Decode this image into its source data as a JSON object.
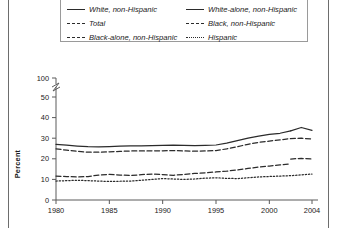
{
  "chart_data": {
    "type": "line",
    "title": "",
    "xlabel": "",
    "ylabel": "Percent",
    "xlim": [
      1980,
      2004
    ],
    "ylim": [
      0,
      50
    ],
    "y_axis_break": true,
    "y_break_top_label": "100",
    "yticks": [
      0,
      10,
      20,
      30,
      40,
      50,
      100
    ],
    "ytick_labels": [
      "0",
      "10",
      "20",
      "30",
      "40",
      "50",
      "100"
    ],
    "xticks": [
      1980,
      1985,
      1990,
      1995,
      2000,
      2004
    ],
    "xtick_labels": [
      "1980",
      "1985",
      "1990",
      "1995",
      "2000",
      "2004"
    ],
    "grid": false,
    "legend_position": "top",
    "series": [
      {
        "name": "White, non-Hispanic",
        "style": "solid",
        "x": [
          1980,
          1981,
          1982,
          1983,
          1984,
          1985,
          1986,
          1987,
          1988,
          1989,
          1990,
          1991,
          1992,
          1993,
          1994,
          1995,
          1996,
          1997,
          1998,
          1999,
          2000,
          2001,
          2002
        ],
        "values": [
          27.0,
          26.6,
          26.2,
          25.9,
          25.8,
          25.9,
          26.1,
          26.3,
          26.3,
          26.4,
          26.5,
          26.6,
          26.5,
          26.4,
          26.5,
          26.7,
          27.6,
          28.8,
          30.0,
          31.0,
          31.8,
          32.4,
          33.6
        ]
      },
      {
        "name": "White-alone, non-Hispanic",
        "style": "solid",
        "x": [
          2002,
          2003,
          2004
        ],
        "values": [
          33.6,
          35.2,
          33.8
        ]
      },
      {
        "name": "Total",
        "style": "dashed",
        "x": [
          1980,
          1981,
          1982,
          1983,
          1984,
          1985,
          1986,
          1987,
          1988,
          1989,
          1990,
          1991,
          1992,
          1993,
          1994,
          1995,
          1996,
          1997,
          1998,
          1999,
          2000,
          2001,
          2002,
          2003,
          2004
        ],
        "values": [
          24.8,
          24.2,
          23.6,
          23.2,
          23.2,
          23.4,
          23.6,
          23.8,
          23.8,
          23.9,
          23.9,
          24.0,
          23.8,
          23.7,
          23.8,
          24.0,
          24.8,
          25.9,
          27.0,
          28.0,
          28.6,
          29.2,
          29.8,
          30.0,
          29.6
        ]
      },
      {
        "name": "Black, non-Hispanic",
        "style": "dashed",
        "x": [
          1980,
          1981,
          1982,
          1983,
          1984,
          1985,
          1986,
          1987,
          1988,
          1989,
          1990,
          1991,
          1992,
          1993,
          1994,
          1995,
          1996,
          1997,
          1998,
          1999,
          2000,
          2001,
          2002
        ],
        "values": [
          11.6,
          11.4,
          11.2,
          11.4,
          12.1,
          12.4,
          12.1,
          11.9,
          12.3,
          12.6,
          12.3,
          12.0,
          12.4,
          12.9,
          13.2,
          13.6,
          14.0,
          14.6,
          15.3,
          16.0,
          16.5,
          17.0,
          17.6
        ]
      },
      {
        "name": "Black-alone, non-Hispanic",
        "style": "dashed",
        "x": [
          2002,
          2003,
          2004
        ],
        "values": [
          19.9,
          20.2,
          19.9
        ]
      },
      {
        "name": "Hispanic",
        "style": "dotted",
        "x": [
          1980,
          1981,
          1982,
          1983,
          1984,
          1985,
          1986,
          1987,
          1988,
          1989,
          1990,
          1991,
          1992,
          1993,
          1994,
          1995,
          1996,
          1997,
          1998,
          1999,
          2000,
          2001,
          2002,
          2003,
          2004
        ],
        "values": [
          9.2,
          9.4,
          9.6,
          9.4,
          9.2,
          9.0,
          9.1,
          9.2,
          9.6,
          10.0,
          10.4,
          10.2,
          10.0,
          10.2,
          10.6,
          10.8,
          10.5,
          10.4,
          10.8,
          11.2,
          11.4,
          11.6,
          11.8,
          12.2,
          12.6
        ]
      }
    ]
  },
  "legend": {
    "items": [
      {
        "label": "White, non-Hispanic",
        "style": "solid"
      },
      {
        "label": "White-alone, non-Hispanic",
        "style": "solid"
      },
      {
        "label": "Total",
        "style": "dashed"
      },
      {
        "label": "Black, non-Hispanic",
        "style": "dashed"
      },
      {
        "label": "Black-alone, non-Hispanic",
        "style": "dashed"
      },
      {
        "label": "Hispanic",
        "style": "dotted"
      }
    ]
  },
  "axis": {
    "y_title": "Percent"
  },
  "colors": {
    "line": "#2b2b2b",
    "axis": "#5a5a5a",
    "frame": "#6d6d6d",
    "text": "#1a1a1a"
  }
}
